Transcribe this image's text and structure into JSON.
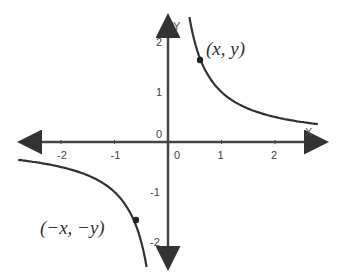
{
  "chart_data": {
    "type": "line",
    "title": "",
    "function": "y = 1/x",
    "xlabel": "X",
    "ylabel": "Y",
    "xlim": [
      -2.7,
      2.7
    ],
    "ylim": [
      -2.5,
      2.5
    ],
    "x_ticks": [
      "-2",
      "-1",
      "0",
      "1",
      "2"
    ],
    "y_ticks": [
      "2",
      "1",
      "0",
      "-1",
      "-2"
    ],
    "grid": false,
    "series": [
      {
        "name": "right branch",
        "x": [
          0.4,
          0.5,
          0.6,
          0.8,
          1,
          1.5,
          2,
          2.7
        ],
        "y": [
          2.5,
          2,
          1.67,
          1.25,
          1,
          0.67,
          0.5,
          0.37
        ]
      },
      {
        "name": "left branch",
        "x": [
          -2.7,
          -2,
          -1.5,
          -1,
          -0.8,
          -0.6,
          -0.5,
          -0.4
        ],
        "y": [
          -0.37,
          -0.5,
          -0.67,
          -1,
          -1.25,
          -1.67,
          -2,
          -2.5
        ]
      }
    ],
    "annotations": [
      {
        "text": "(x, y)",
        "x": 0.6,
        "y": 1.67
      },
      {
        "text": "(−x, −y)",
        "x": -0.6,
        "y": -1.67
      }
    ]
  }
}
